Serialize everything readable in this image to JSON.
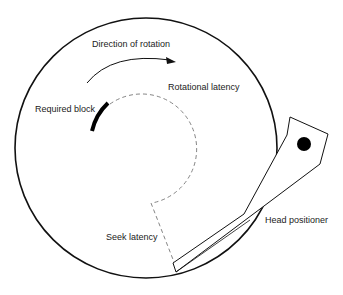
{
  "diagram": {
    "title": "",
    "labels": {
      "direction": "Direction of rotation",
      "rotational": "Rotational latency",
      "block": "Required block",
      "seek": "Seek latency",
      "head": "Head positioner"
    },
    "colors": {
      "stroke": "#111111",
      "dashed": "#777777",
      "background": "#ffffff"
    }
  }
}
